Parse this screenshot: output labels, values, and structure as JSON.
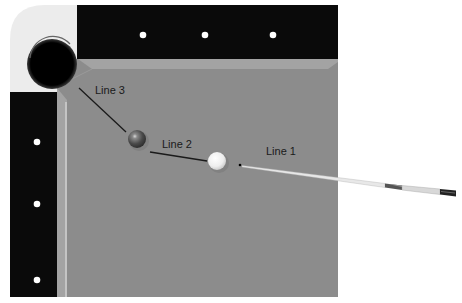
{
  "diagram": {
    "labels": {
      "line1": "Line 1",
      "line2": "Line 2",
      "line3": "Line 3"
    },
    "colors": {
      "rail": "#0a0a0a",
      "cloth": "#8c8c8c",
      "cushion": "#a3a3a3",
      "cushion_highlight": "#c2c2c2",
      "corner": "#ececec",
      "pocket": "#000000",
      "diamond": "#ffffff",
      "object_ball": "#5a5a5a",
      "cue_ball": "#f4f4f4",
      "line": "#1a1a1a"
    },
    "elements": {
      "pocket": "corner-pocket",
      "object_ball": "object-ball",
      "cue_ball": "cue-ball",
      "cue_stick": "cue-stick",
      "top_diamonds": 3,
      "left_diamonds": 3
    }
  }
}
